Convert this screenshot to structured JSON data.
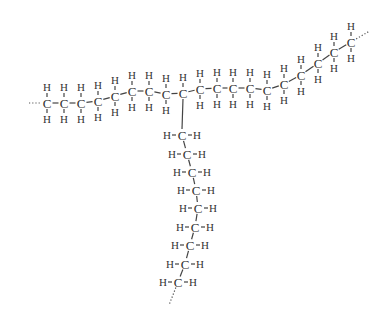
{
  "diagram": {
    "type": "branched-alkane-structural-formula",
    "atom_labels": {
      "carbon": "C",
      "hydrogen": "H"
    },
    "colors": {
      "ink": "#333333",
      "background": "#ffffff"
    },
    "main_chain": {
      "description": "horizontal-to-rising hydrocarbon backbone, chain continues at both ends (dotted)",
      "carbon_count": 19,
      "carbons": [
        {
          "x": 47,
          "y": 103
        },
        {
          "x": 64,
          "y": 103
        },
        {
          "x": 81,
          "y": 103
        },
        {
          "x": 98,
          "y": 101
        },
        {
          "x": 115,
          "y": 96
        },
        {
          "x": 132,
          "y": 91
        },
        {
          "x": 149,
          "y": 91
        },
        {
          "x": 166,
          "y": 94
        },
        {
          "x": 183,
          "y": 93
        },
        {
          "x": 200,
          "y": 89
        },
        {
          "x": 217,
          "y": 88
        },
        {
          "x": 233,
          "y": 88
        },
        {
          "x": 250,
          "y": 88
        },
        {
          "x": 267,
          "y": 90
        },
        {
          "x": 284,
          "y": 84
        },
        {
          "x": 301,
          "y": 75
        },
        {
          "x": 318,
          "y": 63
        },
        {
          "x": 334,
          "y": 52
        },
        {
          "x": 351,
          "y": 42
        }
      ],
      "branch_point_index": 8,
      "branch_point_hydrogens": 1
    },
    "side_chain": {
      "description": "downward hydrocarbon branch with H on left and right of each carbon, continues (dotted) at bottom",
      "carbon_count": 9,
      "carbons": [
        {
          "x": 182,
          "y": 135
        },
        {
          "x": 187,
          "y": 154
        },
        {
          "x": 192,
          "y": 172
        },
        {
          "x": 196,
          "y": 190
        },
        {
          "x": 198,
          "y": 208
        },
        {
          "x": 195,
          "y": 227
        },
        {
          "x": 190,
          "y": 245
        },
        {
          "x": 185,
          "y": 264
        },
        {
          "x": 178,
          "y": 282
        }
      ]
    }
  }
}
